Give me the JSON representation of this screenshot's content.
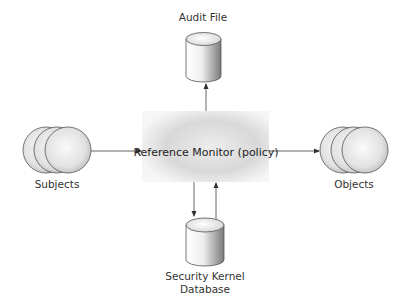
{
  "diagram": {
    "type": "reference-monitor-architecture",
    "nodes": {
      "audit_file": {
        "label": "Audit File",
        "shape": "cylinder"
      },
      "reference_monitor": {
        "label": "Reference Monitor (policy)",
        "shape": "gradient-box"
      },
      "subjects": {
        "label": "Subjects",
        "shape": "stacked-circles"
      },
      "objects": {
        "label": "Objects",
        "shape": "stacked-circles"
      },
      "kernel_db": {
        "label_line1": "Security Kernel",
        "label_line2": "Database",
        "shape": "cylinder"
      }
    },
    "edges": [
      {
        "from": "subjects",
        "to": "reference_monitor"
      },
      {
        "from": "reference_monitor",
        "to": "objects"
      },
      {
        "from": "reference_monitor",
        "to": "audit_file"
      },
      {
        "from": "reference_monitor",
        "to": "kernel_db"
      },
      {
        "from": "kernel_db",
        "to": "reference_monitor"
      }
    ],
    "colors": {
      "line": "#555555",
      "outline": "#444444",
      "fill_light": "#f2f2f2",
      "fill_dark": "#a8a8a8"
    }
  }
}
